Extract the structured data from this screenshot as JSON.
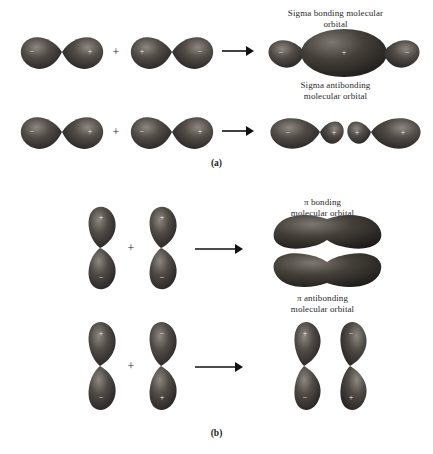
{
  "figure": {
    "panels": [
      {
        "id": "a",
        "label": "(a)",
        "type": "sigma",
        "captions": [
          {
            "id": "sigma-bonding",
            "text": "Sigma bonding molecular\norbital"
          },
          {
            "id": "sigma-antibonding",
            "text": "Sigma antibonding\nmolecular orbital"
          }
        ],
        "rows": [
          {
            "id": "sigma-bonding-row",
            "operator": "+",
            "arrow": "→",
            "reactants": [
              {
                "id": "p-orbital-1",
                "orientation": "horizontal",
                "signs": [
                  "−",
                  "+"
                ]
              },
              {
                "id": "p-orbital-2",
                "orientation": "horizontal",
                "signs": [
                  "+",
                  "−"
                ]
              }
            ],
            "product": {
              "id": "sigma-bonding-mo",
              "signs": [
                "−",
                "+",
                "−"
              ]
            }
          },
          {
            "id": "sigma-antibonding-row",
            "operator": "+",
            "arrow": "→",
            "reactants": [
              {
                "id": "p-orbital-3",
                "orientation": "horizontal",
                "signs": [
                  "−",
                  "+"
                ]
              },
              {
                "id": "p-orbital-4",
                "orientation": "horizontal",
                "signs": [
                  "−",
                  "+"
                ]
              }
            ],
            "product": {
              "id": "sigma-antibonding-mo",
              "signs": [
                "−",
                "+",
                "+",
                "+"
              ]
            }
          }
        ]
      },
      {
        "id": "b",
        "label": "(b)",
        "type": "pi",
        "captions": [
          {
            "id": "pi-bonding",
            "text": "π bonding\nmolecular orbital"
          },
          {
            "id": "pi-antibonding",
            "text": "π antibonding\nmolecular orbital"
          }
        ],
        "rows": [
          {
            "id": "pi-bonding-row",
            "operator": "+",
            "arrow": "→",
            "reactants": [
              {
                "id": "p-orbital-5",
                "orientation": "vertical",
                "signs": [
                  "+",
                  "−"
                ]
              },
              {
                "id": "p-orbital-6",
                "orientation": "vertical",
                "signs": [
                  "+",
                  "−"
                ]
              }
            ],
            "product": {
              "id": "pi-bonding-mo",
              "signs": []
            }
          },
          {
            "id": "pi-antibonding-row",
            "operator": "+",
            "arrow": "→",
            "reactants": [
              {
                "id": "p-orbital-7",
                "orientation": "vertical",
                "signs": [
                  "+",
                  "−"
                ]
              },
              {
                "id": "p-orbital-8",
                "orientation": "vertical",
                "signs": [
                  "−",
                  "+"
                ]
              }
            ],
            "product": {
              "id": "pi-antibonding-mo",
              "signs": [
                "+",
                "−",
                "−",
                "+"
              ]
            }
          }
        ]
      }
    ],
    "colors": {
      "lobe_dark": "#2b2724",
      "lobe_mid": "#4a443f",
      "lobe_light": "#8d8781",
      "background": "#ffffff",
      "text": "#1a1a1a"
    }
  }
}
